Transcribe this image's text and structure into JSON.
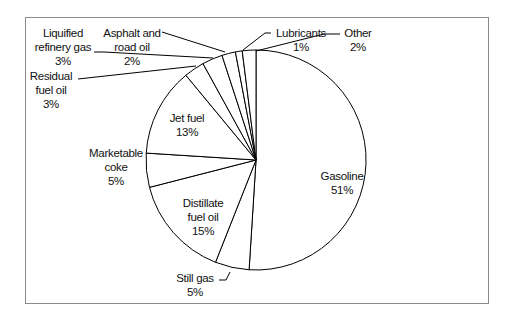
{
  "chart_data": {
    "type": "pie",
    "title": "",
    "start_angle_deg": 0,
    "direction": "clockwise",
    "categories": [
      "Gasoline",
      "Still gas",
      "Distillate fuel oil",
      "Marketable coke",
      "Jet fuel",
      "Residual fuel oil",
      "Liquified refinery gas",
      "Asphalt and road oil",
      "Lubricants",
      "Other"
    ],
    "values": [
      51,
      5,
      15,
      5,
      13,
      3,
      3,
      2,
      1,
      2
    ],
    "value_labels": [
      "51%",
      "5%",
      "15%",
      "5%",
      "13%",
      "3%",
      "3%",
      "2%",
      "1%",
      "2%"
    ],
    "fill": "#ffffff",
    "stroke": "#000000",
    "legend": "none"
  },
  "labels": {
    "gasoline": {
      "name": "Gasoline",
      "pct": "51%"
    },
    "still_gas": {
      "name": "Still gas",
      "pct": "5%"
    },
    "distillate": {
      "line1": "Distillate",
      "line2": "fuel oil",
      "pct": "15%"
    },
    "coke": {
      "line1": "Marketable",
      "line2": "coke",
      "pct": "5%"
    },
    "jet": {
      "name": "Jet fuel",
      "pct": "13%"
    },
    "residual": {
      "line1": "Residual",
      "line2": "fuel oil",
      "pct": "3%"
    },
    "lpg": {
      "line1": "Liquified",
      "line2": "refinery gas",
      "pct": "3%"
    },
    "asphalt": {
      "line1": "Asphalt and",
      "line2": "road oil",
      "pct": "2%"
    },
    "lubricants": {
      "name": "Lubricants",
      "pct": "1%"
    },
    "other": {
      "name": "Other",
      "pct": "2%"
    }
  }
}
